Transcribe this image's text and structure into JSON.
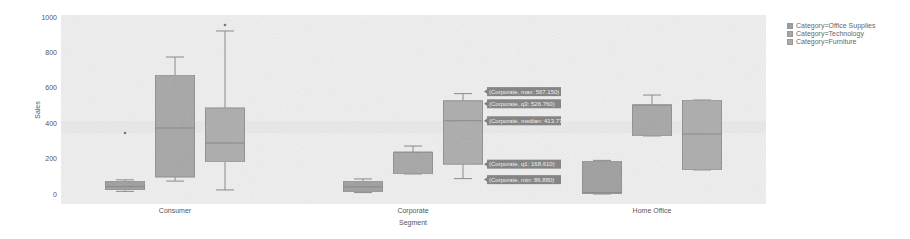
{
  "chart_data": {
    "type": "box",
    "title": "",
    "xlabel": "Segment",
    "ylabel": "Sales",
    "ylim": [
      0,
      1000
    ],
    "yticks": [
      0,
      200,
      400,
      600,
      800,
      1000
    ],
    "categories": [
      "Consumer",
      "Corporate",
      "Home Office"
    ],
    "grid": false,
    "legend_position": "right",
    "series": [
      {
        "name": "Category=Office Supplies",
        "color": "#9e9e9e",
        "boxes": [
          {
            "category": "Consumer",
            "min": 15,
            "q1": 23,
            "median": 42,
            "q3": 73,
            "max": 80,
            "outliers": [
              345
            ]
          },
          {
            "category": "Corporate",
            "min": 8,
            "q1": 12,
            "median": 40,
            "q3": 73,
            "max": 85,
            "outliers": []
          },
          {
            "category": "Home Office",
            "min": 0,
            "q1": 2,
            "median": 8,
            "q3": 186,
            "max": 190,
            "outliers": []
          }
        ]
      },
      {
        "name": "Category=Technology",
        "color": "#a6a6a6",
        "boxes": [
          {
            "category": "Consumer",
            "min": 73,
            "q1": 96,
            "median": 373,
            "q3": 672,
            "max": 774,
            "outliers": []
          },
          {
            "category": "Corporate",
            "min": 113,
            "q1": 113,
            "median": 237,
            "q3": 237,
            "max": 271,
            "outliers": []
          },
          {
            "category": "Home Office",
            "min": 328,
            "q1": 328,
            "median": 503,
            "q3": 503,
            "max": 559,
            "outliers": []
          }
        ]
      },
      {
        "name": "Category=Furniture",
        "color": "#acacac",
        "boxes": [
          {
            "category": "Consumer",
            "min": 23,
            "q1": 181,
            "median": 288,
            "q3": 486,
            "max": 921,
            "outliers": [
              955
            ]
          },
          {
            "category": "Corporate",
            "min": 86.88,
            "q1": 168.61,
            "median": 413.775,
            "q3": 526.76,
            "max": 567.15,
            "outliers": []
          },
          {
            "category": "Home Office",
            "min": 136,
            "q1": 136,
            "median": 339,
            "q3": 531,
            "max": 531,
            "outliers": []
          }
        ]
      }
    ],
    "annotations": [
      "(Corporate, max: 567.150)",
      "(Corporate, q3: 526.760)",
      "(Corporate, median: 413.775)",
      "(Corporate, q1: 168.610)",
      "(Corporate, min: 86.880)"
    ]
  },
  "legend": {
    "items": [
      {
        "label": "Category=Office Supplies",
        "color": "#9e9e9e"
      },
      {
        "label": "Category=Technology",
        "color": "#a6a6a6"
      },
      {
        "label": "Category=Furniture",
        "color": "#acacac"
      }
    ]
  },
  "axes": {
    "xlabel": "Segment",
    "ylabel": "Sales",
    "yticks": [
      "0",
      "200",
      "400",
      "600",
      "800",
      "1000"
    ],
    "xticks": [
      "Consumer",
      "Corporate",
      "Home Office"
    ]
  },
  "hover": {
    "labels": [
      "(Corporate, max: 567.150)",
      "(Corporate, q3: 526.760)",
      "(Corporate, median: 413.775)",
      "(Corporate, q1: 168.610)",
      "(Corporate, min: 86.880)"
    ]
  }
}
